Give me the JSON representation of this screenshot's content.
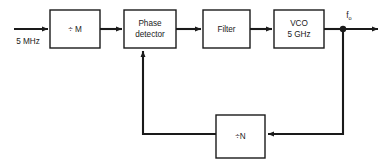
{
  "diagram": {
    "type": "block-diagram",
    "canvas": {
      "width": 384,
      "height": 163
    },
    "stroke_color": "#1a1a1a",
    "background_color": "#ffffff",
    "blocks": [
      {
        "id": "divide-m",
        "name": "divide-by-m-block",
        "lines": [
          "÷ M"
        ],
        "x": 50,
        "y": 10,
        "w": 50,
        "h": 38
      },
      {
        "id": "phase-detector",
        "name": "phase-detector-block",
        "lines": [
          "Phase",
          "detector"
        ],
        "x": 124,
        "y": 10,
        "w": 52,
        "h": 38
      },
      {
        "id": "filter",
        "name": "filter-block",
        "lines": [
          "Filter"
        ],
        "x": 203,
        "y": 10,
        "w": 47,
        "h": 38
      },
      {
        "id": "vco",
        "name": "vco-block",
        "lines": [
          "VCO",
          "5 GHz"
        ],
        "x": 274,
        "y": 10,
        "w": 50,
        "h": 38
      },
      {
        "id": "divide-n",
        "name": "divide-by-n-block",
        "lines": [
          "÷N"
        ],
        "x": 216,
        "y": 115,
        "w": 49,
        "h": 43
      }
    ],
    "signals": {
      "input_label": "5 MHz",
      "output_label_base": "f",
      "output_label_sub": "o"
    }
  }
}
